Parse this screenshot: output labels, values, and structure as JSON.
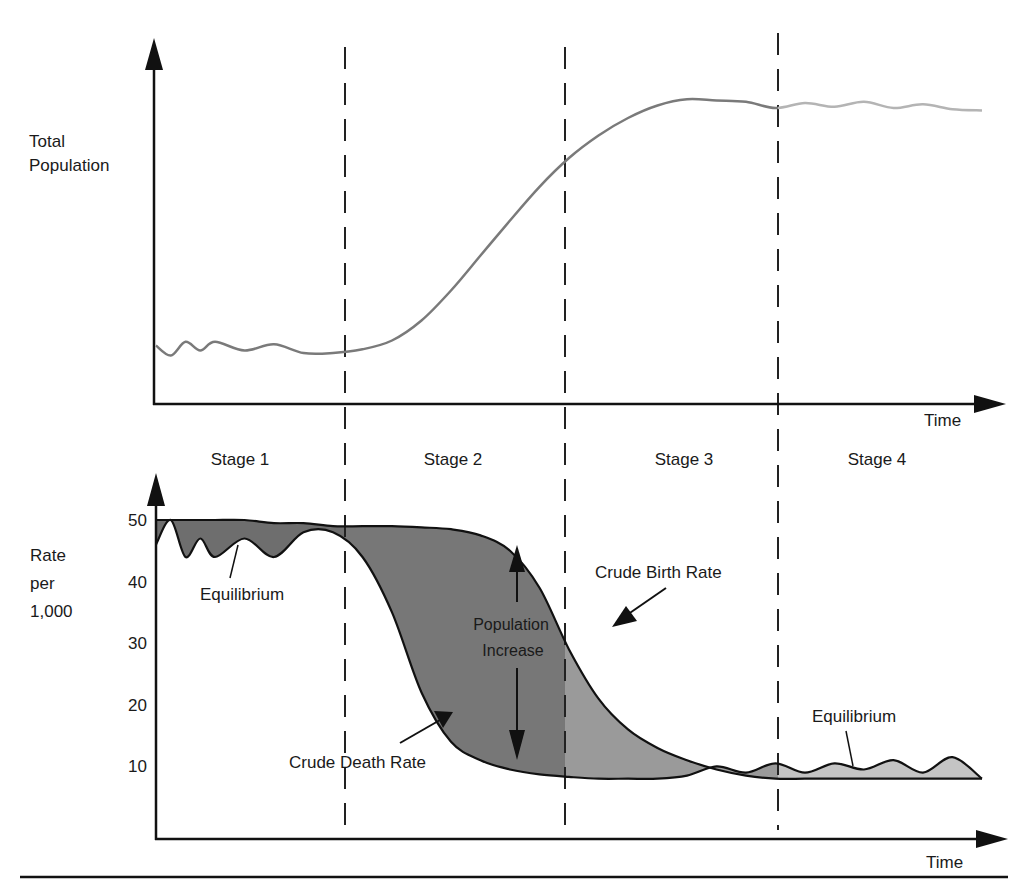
{
  "chart_data": [
    {
      "id": "population",
      "type": "line",
      "title": "",
      "ylabel": [
        "Total",
        "Population"
      ],
      "xlabel": "Time",
      "y_ticks_shown": false,
      "description": "Total population over time through the four stages of the demographic transition",
      "x": [
        0,
        0.25,
        0.5,
        0.75,
        1.0,
        1.5,
        2.0,
        2.5,
        3.0,
        3.5,
        4.0,
        4.5,
        5.0,
        5.5,
        6.0,
        6.5,
        7.0,
        7.5,
        8.0,
        8.5,
        9.0,
        9.5,
        10.0,
        10.5,
        11.0,
        11.5,
        12.0,
        12.5,
        13.0,
        13.5,
        14.0
      ],
      "series": [
        {
          "name": "Total Population",
          "values": [
            18,
            10,
            21,
            14,
            21,
            14,
            19,
            12,
            12,
            15,
            22,
            38,
            62,
            90,
            118,
            145,
            168,
            186,
            200,
            210,
            215,
            214,
            213,
            208,
            212,
            209,
            213,
            208,
            211,
            207,
            206
          ],
          "color": "#7a7a7a",
          "stage4_color": "#b4b4b4"
        }
      ],
      "ylim": [
        0,
        240
      ]
    },
    {
      "id": "rates",
      "type": "area",
      "title": "",
      "ylabel": [
        "Rate",
        "per",
        "1,000"
      ],
      "xlabel": "Time",
      "yticks": [
        10,
        20,
        30,
        40,
        50
      ],
      "ylim": [
        0,
        56
      ],
      "x": [
        0,
        0.25,
        0.5,
        0.75,
        1.0,
        1.5,
        2.0,
        2.5,
        3.0,
        3.5,
        4.0,
        4.5,
        5.0,
        5.5,
        6.0,
        6.5,
        7.0,
        7.5,
        8.0,
        8.5,
        9.0,
        9.5,
        10.0,
        10.5,
        11.0,
        11.5,
        12.0,
        12.5,
        13.0,
        13.5,
        14.0
      ],
      "series": [
        {
          "name": "Crude Birth Rate",
          "values": [
            50,
            50,
            50,
            50,
            50,
            50,
            49.5,
            49.5,
            49,
            49,
            49,
            48.8,
            48.5,
            47.5,
            45,
            39,
            29,
            21,
            16,
            13,
            11,
            9.5,
            8.5,
            8,
            8,
            8,
            8,
            8,
            8,
            8,
            8
          ]
        },
        {
          "name": "Crude Death Rate",
          "values": [
            46,
            50,
            44,
            47,
            44,
            47,
            44,
            48,
            48,
            44,
            35,
            22,
            14,
            11,
            9.5,
            8.7,
            8.3,
            8,
            8,
            8,
            8.5,
            10,
            9,
            10.5,
            9,
            10.5,
            9.5,
            11,
            9,
            11.5,
            8
          ]
        }
      ],
      "fills": {
        "stage1": "#6e6e6e",
        "stage2": "#777777",
        "stage3": "#9a9a9a",
        "stage4": "#c4c4c4"
      }
    }
  ],
  "stages": [
    "Stage 1",
    "Stage 2",
    "Stage 3",
    "Stage 4"
  ],
  "stage_boundaries_x": [
    3.5,
    7.5,
    11.0
  ],
  "annotations": {
    "equilibrium_1": "Equilibrium",
    "equilibrium_2": "Equilibrium",
    "crude_birth_rate": "Crude Birth Rate",
    "crude_death_rate": "Crude Death Rate",
    "population_increase_line1": "Population",
    "population_increase_line2": "Increase"
  },
  "labels": {
    "top_ylabel_1": "Total",
    "top_ylabel_2": "Population",
    "bottom_ylabel_1": "Rate",
    "bottom_ylabel_2": "per",
    "bottom_ylabel_3": "1,000",
    "top_xlabel": "Time",
    "bottom_xlabel": "Time"
  }
}
